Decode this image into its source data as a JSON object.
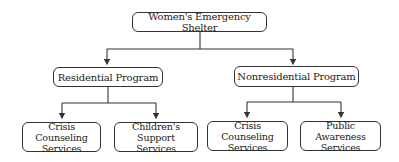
{
  "diagram": {
    "type": "org-chart",
    "root": {
      "id": "shelter",
      "label": "Women's Emergency Shelter"
    },
    "level1": [
      {
        "id": "residential",
        "label": "Residential Program"
      },
      {
        "id": "nonresidential",
        "label": "Nonresidential Program"
      }
    ],
    "level2": [
      {
        "id": "res-crisis",
        "parent": "residential",
        "line1": "Crisis Counseling",
        "line2": "Services"
      },
      {
        "id": "res-children",
        "parent": "residential",
        "line1": "Children's Support",
        "line2": "Services"
      },
      {
        "id": "non-crisis",
        "parent": "nonresidential",
        "line1": "Crisis Counseling",
        "line2": "Services"
      },
      {
        "id": "non-public",
        "parent": "nonresidential",
        "line1": "Public Awareness",
        "line2": "Services"
      }
    ],
    "colors": {
      "line": "#333333",
      "background": "#ffffff",
      "text": "#222222"
    }
  }
}
